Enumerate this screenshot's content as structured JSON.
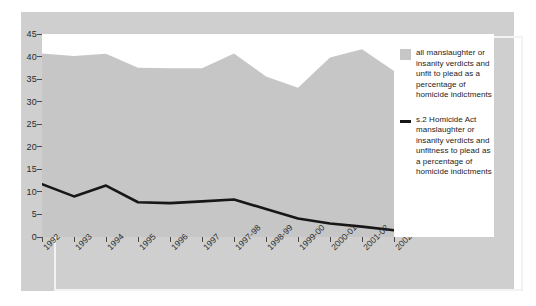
{
  "chart_data": {
    "type": "area",
    "title": "",
    "subtitle": "",
    "xlabel": "",
    "ylabel": "",
    "ylim": [
      0,
      45
    ],
    "ytick_step": 5,
    "grid": false,
    "legend_position": "right",
    "categories": [
      "1992",
      "1993",
      "1994",
      "1995",
      "1996",
      "1997",
      "1997-98",
      "1998-99",
      "1999-00",
      "2000-01",
      "2001-02",
      "2002-03"
    ],
    "yticks": [
      "45",
      "40",
      "35",
      "30",
      "25",
      "20",
      "15",
      "10",
      "5",
      "0"
    ],
    "series": [
      {
        "name": "all manslaughter or insanity verdicts and unfit to plead as a percentage of homicide indictments",
        "type": "area",
        "color": "#c6c6c6",
        "values": [
          40.7,
          40.1,
          40.6,
          37.5,
          37.4,
          37.4,
          40.7,
          35.6,
          33.1,
          39.8,
          41.6,
          36.8
        ]
      },
      {
        "name": "s.2 Homicide Act manslaughter or insanity verdicts and unfitness to plead as a percentage of homicide indictments",
        "type": "line",
        "color": "#171717",
        "values": [
          11.7,
          9.0,
          11.4,
          7.7,
          7.5,
          7.9,
          8.3,
          6.2,
          4.1,
          3.0,
          2.3,
          1.5
        ]
      }
    ]
  },
  "legend": {
    "entries": [
      {
        "marker": "area-swatch",
        "label": "all manslaughter or insanity verdicts and unfit to plead as a percentage of homicide indictments"
      },
      {
        "marker": "line-swatch",
        "label": "s.2 Homicide Act manslaughter or insanity verdicts and unfitness to plead as a percentage of homicide indictments"
      }
    ]
  },
  "colors": {
    "page_background": "#ffffff",
    "card_background": "#cfcfcf",
    "inner_rule": "#f2f2f2",
    "plot_background": "#ffffff",
    "area_fill": "#c6c6c6",
    "line_stroke": "#171717",
    "axis_text": "#2b2b2b",
    "tick_mark": "#4a4a4a"
  }
}
